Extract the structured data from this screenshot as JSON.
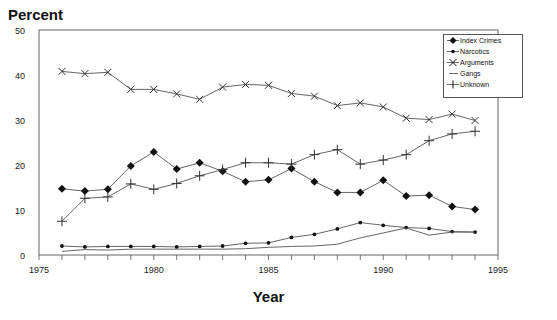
{
  "chart_data": {
    "type": "line",
    "title": "",
    "ylabel": "Percent",
    "xlabel": "Year",
    "xlim": [
      1975,
      1995
    ],
    "ylim": [
      0,
      50
    ],
    "x_ticks": [
      1975,
      1980,
      1985,
      1990,
      1995
    ],
    "y_ticks": [
      0,
      10,
      20,
      30,
      40,
      50
    ],
    "grid": false,
    "legend_position": "top-right",
    "x": [
      1976,
      1977,
      1978,
      1979,
      1980,
      1981,
      1982,
      1983,
      1984,
      1985,
      1986,
      1987,
      1988,
      1989,
      1990,
      1991,
      1992,
      1993,
      1994
    ],
    "series": [
      {
        "name": "Index Crimes",
        "marker": "diamond",
        "values": [
          14.7,
          14.2,
          14.6,
          19.8,
          22.9,
          19.1,
          20.5,
          18.6,
          16.3,
          16.7,
          19.2,
          16.3,
          13.9,
          13.9,
          16.6,
          13.1,
          13.3,
          10.8,
          10.1
        ]
      },
      {
        "name": "Narcotics",
        "marker": "dot",
        "values": [
          2.0,
          1.8,
          1.9,
          1.9,
          1.9,
          1.8,
          1.9,
          2.0,
          2.6,
          2.7,
          3.9,
          4.6,
          5.8,
          7.2,
          6.6,
          6.1,
          5.9,
          5.2,
          5.1
        ]
      },
      {
        "name": "Arguments",
        "marker": "x",
        "values": [
          40.8,
          40.3,
          40.6,
          36.8,
          36.8,
          35.8,
          34.6,
          37.3,
          37.9,
          37.7,
          35.9,
          35.3,
          33.2,
          33.8,
          32.9,
          30.4,
          30.1,
          31.3,
          29.9
        ]
      },
      {
        "name": "Gangs",
        "marker": "none",
        "values": [
          0.8,
          1.2,
          1.1,
          1.3,
          1.3,
          1.3,
          1.3,
          1.3,
          1.4,
          1.7,
          1.9,
          2.0,
          2.4,
          3.8,
          4.9,
          6.0,
          4.4,
          5.1,
          5.1
        ]
      },
      {
        "name": "Unknown",
        "marker": "plus",
        "values": [
          7.5,
          12.6,
          12.9,
          15.8,
          14.6,
          15.9,
          17.6,
          19.0,
          20.5,
          20.5,
          20.2,
          22.3,
          23.4,
          20.2,
          21.1,
          22.3,
          25.4,
          26.9,
          27.5
        ]
      }
    ]
  },
  "labels": {
    "y_title": "Percent",
    "x_title": "Year"
  },
  "legend": [
    {
      "label": "Index Crimes",
      "marker": "diamond"
    },
    {
      "label": "Narcotics",
      "marker": "dot"
    },
    {
      "label": "Arguments",
      "marker": "x"
    },
    {
      "label": "Gangs",
      "marker": "none"
    },
    {
      "label": "Unknown",
      "marker": "plus"
    }
  ]
}
